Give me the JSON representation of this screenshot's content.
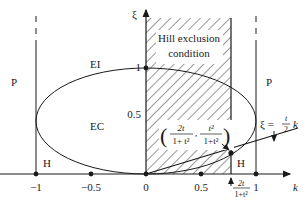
{
  "axes": {
    "x_label": "k",
    "y_label": "ξ",
    "x_ticks": [
      "−1",
      "−0.5",
      "0",
      "0.5",
      "1"
    ],
    "y_ticks": [
      "0.5",
      "1"
    ]
  },
  "regions": {
    "hatched_label_line1": "Hill exclusion",
    "hatched_label_line2": "condition",
    "left_P": "P",
    "right_P": "P",
    "left_H": "H",
    "right_H": "H",
    "EI": "EI",
    "EC": "EC"
  },
  "annotations": {
    "point_open": "(",
    "point_num1": "2t",
    "point_den1": "1+ t²",
    "point_comma": ",",
    "point_num2": "t²",
    "point_den2": "1+t²",
    "point_close": ")",
    "line_eq_lhs": "ξ =",
    "line_eq_num": "t",
    "line_eq_den": "2",
    "line_eq_k": "k",
    "x_marker_num": "2t",
    "x_marker_den": "1+t²"
  },
  "colors": {
    "stroke": "#1a1a1a",
    "background": "#ffffff"
  }
}
